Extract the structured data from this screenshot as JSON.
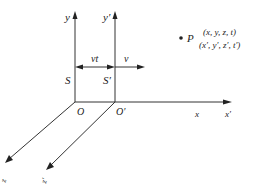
{
  "diagram": {
    "title": "",
    "frames": [
      {
        "name": "S",
        "origin_label": "O",
        "axes": {
          "x": "x",
          "y": "y",
          "z": "z"
        }
      },
      {
        "name": "S′",
        "origin_label": "O′",
        "axes": {
          "x": "x′",
          "y": "y′",
          "z": "z′"
        }
      }
    ],
    "labels": {
      "y": "y",
      "y_prime": "y′",
      "S": "S",
      "S_prime": "S′",
      "O": "O",
      "O_prime": "O′",
      "x": "x",
      "x_prime": "x′",
      "z": "z",
      "z_prime": "z′",
      "vt": "vt",
      "v": "v",
      "P": "P",
      "P_coords": "(x, y, z, t)",
      "P_coords_prime": "(x′, y′, z′, t′)"
    },
    "colors": {
      "line": "#333333",
      "text": "#222222",
      "background": "#ffffff"
    }
  }
}
